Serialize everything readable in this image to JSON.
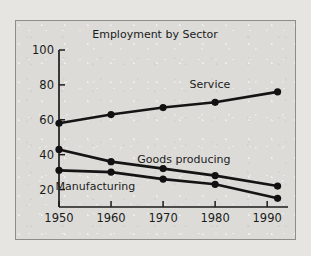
{
  "chart_data": {
    "type": "line",
    "title": "Employment by Sector",
    "xlabel": "",
    "ylabel": "",
    "x": [
      1950,
      1960,
      1970,
      1980,
      1992
    ],
    "xtick_labels": [
      "1950",
      "1960",
      "1970",
      "1980",
      "1990"
    ],
    "xticks": [
      1950,
      1960,
      1970,
      1980,
      1990
    ],
    "ytick_labels": [
      "20",
      "40",
      "60",
      "80",
      "100"
    ],
    "yticks": [
      20,
      40,
      60,
      80,
      100
    ],
    "xlim": [
      1950,
      1994
    ],
    "ylim": [
      10,
      100
    ],
    "grid": false,
    "legend": "inline-labels",
    "series": [
      {
        "name": "Service",
        "values": [
          58,
          63,
          67,
          70,
          76
        ],
        "label": "Service"
      },
      {
        "name": "Goods producing",
        "values": [
          43,
          36,
          32,
          28,
          22
        ],
        "label": "Goods producing"
      },
      {
        "name": "Manufacturing",
        "values": [
          31,
          30,
          26,
          23,
          15
        ],
        "label": "Manufacturing"
      }
    ],
    "annotations": [
      {
        "text": "Service",
        "x": 1979,
        "y": 78
      },
      {
        "text": "Goods producing",
        "x": 1974,
        "y": 35
      },
      {
        "text": "Manufacturing",
        "x": 1957,
        "y": 20
      }
    ],
    "colors": {
      "line": "#141414",
      "marker": "#111111",
      "axis": "#1c1c1c",
      "text": "#1b1b1b",
      "plot_background": "#dcdbd8",
      "page_background": "#e6e5e2",
      "frame_border": "#8e8d8a"
    }
  }
}
